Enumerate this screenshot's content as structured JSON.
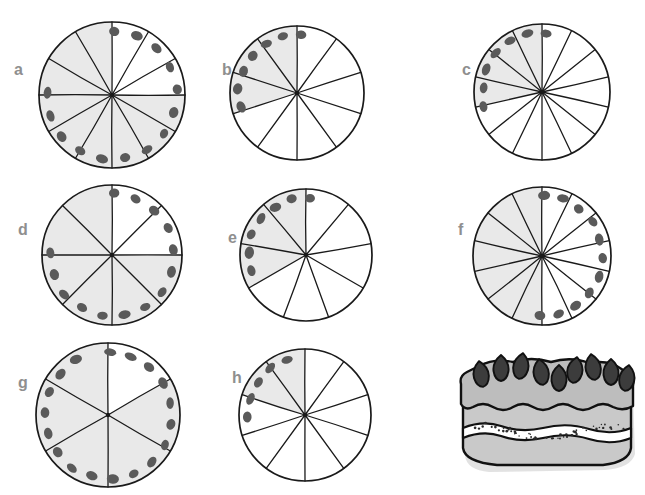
{
  "page": {
    "background_color": "#ffffff",
    "width": 645,
    "height": 495
  },
  "style": {
    "outline_color": "#1a1a1a",
    "shaded_fill": "#e9e9e9",
    "unshaded_fill": "#ffffff",
    "berry_color": "#5a5a5a",
    "label_color": "#8f8f8f",
    "cake_sponge": "#c9c9c9",
    "cake_cream": "#ffffff",
    "cake_frosting": "#bdbdbd",
    "cake_berry": "#3c3c3c",
    "cake_shadow": "#d8d8d8"
  },
  "figures": [
    {
      "label": "a",
      "label_x": 14,
      "label_y": 62,
      "cx": 112,
      "cy": 95,
      "r": 73,
      "slices": 12,
      "shaded": 9,
      "fraction": "9/12",
      "berries": 14,
      "berry_start_deg": -88,
      "berry_end_deg": 182
    },
    {
      "label": "b",
      "label_x": 222,
      "label_y": 62,
      "cx": 297,
      "cy": 93,
      "r": 67,
      "slices": 10,
      "shaded": 3,
      "fraction": "3/10",
      "berries": 7,
      "berry_start_deg": -86,
      "berry_end_deg": -194
    },
    {
      "label": "c",
      "label_x": 462,
      "label_y": 62,
      "cx": 542,
      "cy": 92,
      "r": 68,
      "slices": 14,
      "shaded": 4,
      "fraction": "4/14",
      "berries": 7,
      "berry_start_deg": -86,
      "berry_end_deg": -194
    },
    {
      "label": "d",
      "label_x": 18,
      "label_y": 222,
      "cx": 112,
      "cy": 255,
      "r": 70,
      "slices": 8,
      "shaded": 6,
      "fraction": "6/8",
      "berries": 14,
      "berry_start_deg": -88,
      "berry_end_deg": 182
    },
    {
      "label": "e",
      "label_x": 228,
      "label_y": 230,
      "cx": 306,
      "cy": 255,
      "r": 66,
      "slices": 9,
      "shaded": 3,
      "fraction": "3/9",
      "berries": 7,
      "berry_start_deg": -86,
      "berry_end_deg": -196
    },
    {
      "label": "f",
      "label_x": 458,
      "label_y": 222,
      "cx": 542,
      "cy": 256,
      "r": 69,
      "slices": 14,
      "shaded": 7,
      "fraction": "7/14",
      "berries": 11,
      "berry_start_deg": -88,
      "berry_end_deg": 92
    },
    {
      "label": "g",
      "label_x": 18,
      "label_y": 375,
      "cx": 108,
      "cy": 415,
      "r": 72,
      "slices": 6,
      "shaded": 5,
      "fraction": "5/6",
      "berries": 18,
      "berry_start_deg": -88,
      "berry_end_deg": 240
    },
    {
      "label": "h",
      "label_x": 232,
      "label_y": 370,
      "cx": 305,
      "cy": 415,
      "r": 66,
      "slices": 10,
      "shaded": 2,
      "fraction": "2/10",
      "berries": 5,
      "berry_start_deg": -108,
      "berry_end_deg": -182
    }
  ],
  "cake": {
    "name": "strawberry-layer-cake",
    "x": 455,
    "y": 350,
    "width": 185,
    "height": 140,
    "strawberry_count": 9,
    "layers": [
      "frosting-top",
      "cream-filling",
      "sponge-base"
    ]
  }
}
